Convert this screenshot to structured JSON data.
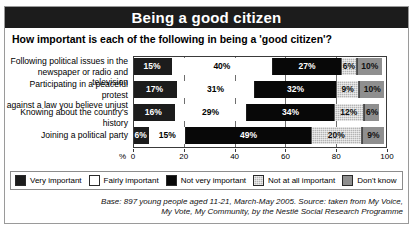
{
  "title": "Being a good citizen",
  "subtitle": "How important is each of the following in being a 'good citizen'?",
  "axis_unit": "%",
  "caption_line1": "Base: 897 young people aged 11-21, March-May 2005. Source: taken from My Voice,",
  "caption_line2": "My Vote, My Community, by the Nestlé Social Research Programme",
  "chart_data": {
    "type": "bar",
    "orientation": "horizontal",
    "stacked": true,
    "title": "Being a good citizen",
    "subtitle": "How important is each of the following in being a 'good citizen'?",
    "xlabel": "%",
    "ylabel": "",
    "xlim": [
      0,
      100
    ],
    "ticks": [
      0,
      20,
      40,
      60,
      80,
      100
    ],
    "grid": true,
    "legend_position": "bottom",
    "categories": [
      "Following political issues in the newspaper or radio and television",
      "Participating in a peaceful protest against a law you believe unjust",
      "Knowing about the country's history",
      "Joining a political party"
    ],
    "category_lines": [
      [
        "Following political issues in the",
        "newspaper or radio and television"
      ],
      [
        "Participating in a peaceful protest",
        "against a law you believe unjust"
      ],
      [
        "Knowing about the country's history"
      ],
      [
        "Joining a political party"
      ]
    ],
    "series": [
      {
        "name": "Very important",
        "color": "#1c1c1c",
        "values": [
          15,
          17,
          16,
          6
        ]
      },
      {
        "name": "Fairly important",
        "color": "#ffffff",
        "values": [
          40,
          31,
          29,
          15
        ]
      },
      {
        "name": "Not very important",
        "color": "#080808",
        "values": [
          27,
          32,
          34,
          49
        ]
      },
      {
        "name": "Not at all important",
        "color": "#b4b4b4",
        "values": [
          6,
          9,
          12,
          20
        ]
      },
      {
        "name": "Don't know",
        "color": "#8f8f8f",
        "values": [
          10,
          10,
          6,
          9
        ]
      }
    ],
    "labels": [
      [
        "15%",
        "40%",
        "27%",
        "6%",
        "10%"
      ],
      [
        "17%",
        "31%",
        "32%",
        "9%",
        "10%"
      ],
      [
        "16%",
        "29%",
        "34%",
        "12%",
        "6%"
      ],
      [
        "6%",
        "15%",
        "49%",
        "20%",
        "9%"
      ]
    ]
  }
}
